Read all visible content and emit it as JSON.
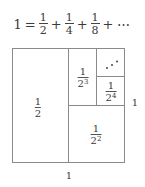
{
  "equation": {
    "lhs": "1",
    "equals": "=",
    "terms": [
      {
        "num": "1",
        "den": "2"
      },
      {
        "num": "1",
        "den": "4"
      },
      {
        "num": "1",
        "den": "8"
      }
    ],
    "plus": "+",
    "ellipsis": "⋯"
  },
  "diagram": {
    "line_color": "#888888",
    "square": {
      "x": 12,
      "y": 48,
      "size": 112
    },
    "cells": [
      {
        "id": "half",
        "label_num": "1",
        "label_base": "2",
        "label_exp": ""
      },
      {
        "id": "quarter",
        "label_num": "1",
        "label_base": "2",
        "label_exp": "2"
      },
      {
        "id": "eighth",
        "label_num": "1",
        "label_base": "2",
        "label_exp": "3"
      },
      {
        "id": "sixteenth",
        "label_num": "1",
        "label_base": "2",
        "label_exp": "4"
      }
    ],
    "remainder_symbol": "⋰"
  },
  "axis_labels": {
    "bottom": "1",
    "right": "1"
  }
}
